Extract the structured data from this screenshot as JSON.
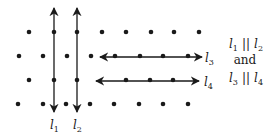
{
  "diagram": {
    "colors": {
      "ink": "#1a1a1a",
      "background": "#ffffff"
    },
    "dots": [
      [
        29,
        32
      ],
      [
        54,
        32
      ],
      [
        77,
        32
      ],
      [
        102,
        32
      ],
      [
        126,
        32
      ],
      [
        151,
        32
      ],
      [
        174,
        32
      ],
      [
        199,
        32
      ],
      [
        19,
        56
      ],
      [
        43,
        56
      ],
      [
        67,
        56
      ],
      [
        91,
        56
      ],
      [
        115,
        56
      ],
      [
        140,
        56
      ],
      [
        163,
        56
      ],
      [
        188,
        56
      ],
      [
        29,
        80
      ],
      [
        54,
        80
      ],
      [
        77,
        80
      ],
      [
        126,
        80
      ],
      [
        150,
        80
      ],
      [
        173,
        80
      ],
      [
        18,
        104
      ],
      [
        43,
        104
      ],
      [
        66,
        104
      ],
      [
        90,
        104
      ],
      [
        114,
        104
      ],
      [
        139,
        104
      ],
      [
        163,
        104
      ],
      [
        188,
        104
      ]
    ],
    "lines": [
      {
        "id": "l1",
        "orientation": "vertical",
        "x": 54,
        "y1": 8,
        "y2": 112,
        "label": "l",
        "subscript": "1",
        "label_pos": [
          50,
          129
        ]
      },
      {
        "id": "l2",
        "orientation": "vertical",
        "x": 77,
        "y1": 8,
        "y2": 112,
        "label": "l",
        "subscript": "2",
        "label_pos": [
          73,
          129
        ]
      },
      {
        "id": "l3",
        "orientation": "horizontal",
        "y": 57,
        "x1": 100,
        "x2": 202,
        "label": "l",
        "subscript": "3",
        "label_pos": [
          205,
          62
        ]
      },
      {
        "id": "l4",
        "orientation": "horizontal",
        "y": 81,
        "x1": 96,
        "x2": 199,
        "label": "l",
        "subscript": "4",
        "label_pos": [
          204,
          86
        ]
      }
    ],
    "statement": {
      "line1": {
        "a": "l",
        "a_sub": "1",
        "op": "||",
        "b": "l",
        "b_sub": "2"
      },
      "line2": "and",
      "line3": {
        "a": "l",
        "a_sub": "3",
        "op": "||",
        "b": "l",
        "b_sub": "4"
      }
    }
  }
}
